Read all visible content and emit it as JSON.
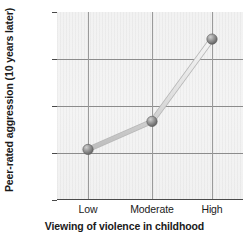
{
  "chart_data": {
    "type": "line",
    "title": "",
    "subtitle": "",
    "xlabel": "Viewing of violence in childhood",
    "ylabel": "Peer-rated aggression (10 years later)",
    "categories": [
      "Low",
      "Moderate",
      "High"
    ],
    "values": [
      53,
      83,
      171
    ],
    "series": [
      {
        "name": "Peer-rated aggression",
        "values": [
          53,
          83,
          171
        ]
      }
    ],
    "ylim": [
      0,
      200
    ],
    "yticks": [
      0,
      50,
      100,
      150,
      200
    ],
    "ytick_labels": [
      "0",
      "50",
      "100",
      "150",
      "200"
    ],
    "xtick_labels": [
      "Low",
      "Moderate",
      "High"
    ],
    "grid": true,
    "legend": "none",
    "marker": "circle",
    "colors": {
      "marker_fill": "#8a8a8a",
      "marker_highlight": "#c9c9c9",
      "marker_edge": "#5a5a5a",
      "line": "#dcdcdc",
      "line_edge": "#b4b4b4",
      "plot_background": "#f2f2f2",
      "gridline": "#8c8c8c",
      "axis": "#4a4a4a",
      "text": "#1a1a1a"
    }
  },
  "figure": {
    "y_axis_title": "Peer-rated aggression (10 years later)",
    "x_axis_title": "Viewing of violence in childhood",
    "y_ticks": [
      {
        "label": "200",
        "value": 200
      },
      {
        "label": "150",
        "value": 150
      },
      {
        "label": "100",
        "value": 100
      },
      {
        "label": "50",
        "value": 50
      },
      {
        "label": "0",
        "value": 0
      }
    ],
    "x_ticks": [
      {
        "label": "Low",
        "value": 53
      },
      {
        "label": "Moderate",
        "value": 83
      },
      {
        "label": "High",
        "value": 171
      }
    ]
  }
}
